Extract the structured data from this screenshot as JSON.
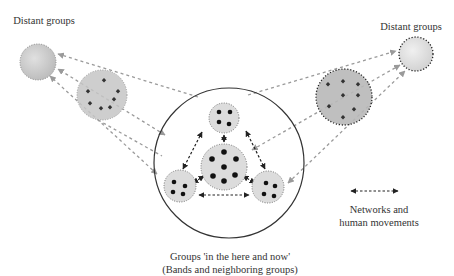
{
  "labels": {
    "distant_left": "Distant groups",
    "distant_right": "Distant groups",
    "legend_line1": "Networks and",
    "legend_line2": "human movements",
    "caption_line1": "Groups 'in the here and now'",
    "caption_line2": "(Bands and neighboring groups)"
  },
  "colors": {
    "background": "#ffffff",
    "light_fill": "#dcdcdc",
    "mid_fill": "#c8c8c8",
    "dark_fill": "#b5b5b5",
    "gray_arrow": "#9a9a9a",
    "dark_arrow": "#222222",
    "big_circle_stroke": "#333333"
  },
  "nodes": {
    "distant_left": {
      "cx": 38,
      "cy": 62,
      "r": 18
    },
    "distant_right": {
      "cx": 416,
      "cy": 54,
      "r": 17
    },
    "mid_left": {
      "cx": 102,
      "cy": 95,
      "r": 25
    },
    "mid_right": {
      "cx": 344,
      "cy": 97,
      "r": 28
    },
    "band_circle": {
      "cx": 229,
      "cy": 163,
      "r": 75
    },
    "inner_top": {
      "cx": 224,
      "cy": 118,
      "r": 15
    },
    "inner_center": {
      "cx": 224,
      "cy": 167,
      "r": 23
    },
    "inner_bottom_left": {
      "cx": 180,
      "cy": 186,
      "r": 16
    },
    "inner_bottom_right": {
      "cx": 268,
      "cy": 187,
      "r": 16
    }
  },
  "legend": {
    "arrow": "dashed double-headed arrow"
  }
}
